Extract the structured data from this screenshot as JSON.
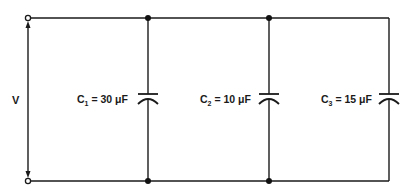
{
  "diagram": {
    "voltage_label": "V",
    "capacitors": [
      {
        "name": "C",
        "subscript": "1",
        "equals": " = ",
        "value": "30",
        "unit": " μF"
      },
      {
        "name": "C",
        "subscript": "2",
        "equals": " = ",
        "value": "10",
        "unit": " μF"
      },
      {
        "name": "C",
        "subscript": "3",
        "equals": " = ",
        "value": "15",
        "unit": " μF"
      }
    ],
    "colors": {
      "line": "#1a1a1a",
      "background": "#ffffff"
    }
  }
}
